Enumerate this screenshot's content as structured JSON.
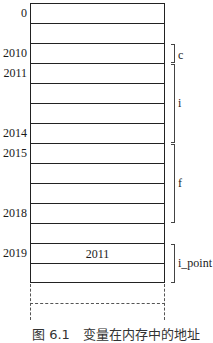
{
  "diagram": {
    "cells": [
      "",
      "",
      "",
      "",
      "",
      "",
      "",
      "",
      "",
      "",
      "",
      "",
      "2011",
      ""
    ],
    "address_labels": [
      {
        "text": "0",
        "row": 0
      },
      {
        "text": "2010",
        "row": 2
      },
      {
        "text": "2011",
        "row": 3
      },
      {
        "text": "2014",
        "row": 6
      },
      {
        "text": "2015",
        "row": 7
      },
      {
        "text": "2018",
        "row": 10
      },
      {
        "text": "2019",
        "row": 12
      }
    ],
    "brackets": [
      {
        "label": "c",
        "start_row": 2,
        "end_row": 2
      },
      {
        "label": "i",
        "start_row": 3,
        "end_row": 6
      },
      {
        "label": "f",
        "start_row": 7,
        "end_row": 10
      },
      {
        "label": "i_point",
        "start_row": 12,
        "end_row": 13
      }
    ],
    "caption": "图 6.1　变量在内存中的地址"
  }
}
